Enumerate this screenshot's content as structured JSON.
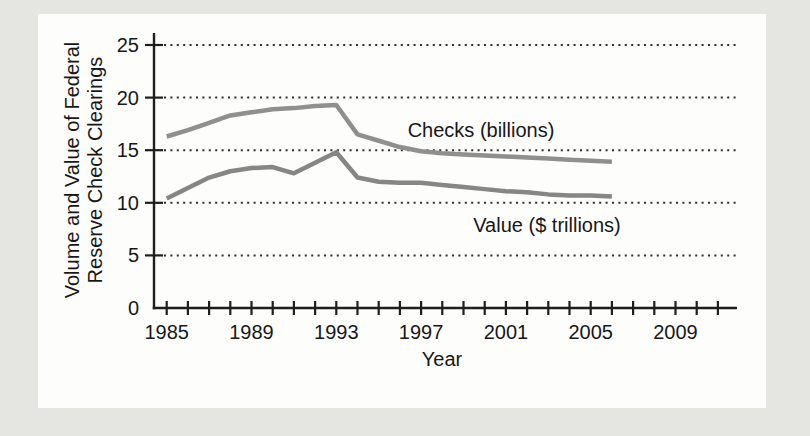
{
  "page": {
    "background_color": "#e5e5e2",
    "panel_color": "#fdfdfc"
  },
  "chart_data": {
    "type": "line",
    "title": "",
    "y_axis_title_lines": [
      "Volume and Value of Federal",
      "Reserve Check Clearings"
    ],
    "xlabel": "Year",
    "ylim": [
      0,
      25
    ],
    "y_ticks": [
      0,
      5,
      10,
      15,
      20,
      25
    ],
    "y_gridlines": [
      5,
      10,
      15,
      20,
      25
    ],
    "grid_style": "horizontal-dotted",
    "x_ticks_start": 1985,
    "x_ticks_end": 2011,
    "x_tick_step": 1,
    "x_label_years": [
      1985,
      1989,
      1993,
      1997,
      2001,
      2005,
      2009
    ],
    "years": [
      1985,
      1986,
      1987,
      1988,
      1989,
      1990,
      1991,
      1992,
      1993,
      1994,
      1995,
      1996,
      1997,
      1998,
      1999,
      2000,
      2001,
      2002,
      2003,
      2004,
      2005,
      2006
    ],
    "series": [
      {
        "name": "Checks (billions)",
        "color": "#8f8f8f",
        "values": [
          16.3,
          16.9,
          17.6,
          18.3,
          18.6,
          18.9,
          19.0,
          19.2,
          19.3,
          16.5,
          15.9,
          15.3,
          14.9,
          14.7,
          14.6,
          14.5,
          14.4,
          14.3,
          14.2,
          14.1,
          14.0,
          13.9
        ]
      },
      {
        "name": "Value ($ trillions)",
        "color": "#868686",
        "values": [
          10.4,
          11.4,
          12.4,
          13.0,
          13.3,
          13.4,
          12.8,
          13.8,
          14.8,
          12.4,
          12.0,
          11.9,
          11.9,
          11.7,
          11.5,
          11.3,
          11.1,
          11.0,
          10.8,
          10.7,
          10.7,
          10.6
        ]
      }
    ],
    "colors": {
      "axis": "#1e1e1e",
      "gridline": "#2d2d2d",
      "text": "#171717"
    }
  }
}
